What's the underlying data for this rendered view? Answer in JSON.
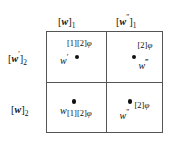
{
  "figure": {
    "type": "2x2-grid-diagram",
    "background_color": "#ffffff",
    "line_color": "#555555",
    "text_color": "#111111",
    "columns": [
      {
        "id": "col-1",
        "label_base": "w",
        "label_primes": "",
        "label_subscript": "1",
        "label_text": "[w]₁"
      },
      {
        "id": "col-2",
        "label_base": "w",
        "label_primes": "″",
        "label_subscript": "1",
        "label_text": "[w″]₁"
      }
    ],
    "rows": [
      {
        "id": "row-1",
        "label_base": "w",
        "label_primes": "′",
        "label_subscript": "2",
        "label_text": "[w′]₂"
      },
      {
        "id": "row-2",
        "label_base": "w",
        "label_primes": "",
        "label_subscript": "2",
        "label_text": "[w]₂"
      }
    ],
    "cells": [
      {
        "id": "cell-top-left",
        "row": "row-1",
        "column": "col-1",
        "point_label": "w",
        "point_primes": "′",
        "annotation": "[1][2]",
        "annotation_symbol": "φ",
        "annotation_full": "[1][2]φ"
      },
      {
        "id": "cell-top-right",
        "row": "row-1",
        "column": "col-2",
        "point_label": "w",
        "point_primes": "‴",
        "annotation": "[2]",
        "annotation_symbol": "φ",
        "annotation_full": "[2]φ"
      },
      {
        "id": "cell-bottom-left",
        "row": "row-2",
        "column": "col-1",
        "point_label": "w",
        "point_primes": "",
        "annotation": "[1][2]",
        "annotation_symbol": "φ",
        "annotation_full": "[1][2]φ"
      },
      {
        "id": "cell-bottom-right",
        "row": "row-2",
        "column": "col-2",
        "point_label": "w",
        "point_primes": "″",
        "annotation": "[2]",
        "annotation_symbol": "φ",
        "annotation_full": "[2]φ"
      }
    ]
  }
}
